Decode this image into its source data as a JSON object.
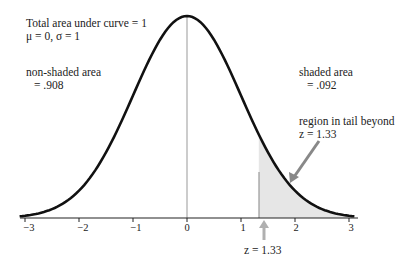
{
  "chart_data": {
    "type": "area",
    "annotations": {
      "total": "Total area under curve = 1",
      "params": "μ = 0, σ = 1",
      "nonshaded_label": "non-shaded area",
      "nonshaded_value": "= .908",
      "shaded_label": "shaded area",
      "shaded_value": "= .092",
      "tail_label": "region in tail beyond",
      "tail_z": "z = 1.33",
      "z_marker": "z = 1.33"
    },
    "x_ticks": [
      "−3",
      "−2",
      "−1",
      "0",
      "1",
      "2",
      "3"
    ],
    "xlim": [
      -3,
      3
    ],
    "mu": 0,
    "sigma": 1,
    "shaded_from": 1.33,
    "shaded_area": 0.092,
    "nonshaded_area": 0.908,
    "colors": {
      "curve": "#111111",
      "shade": "#e6e6e6",
      "arrow": "#8a8a8a",
      "marker": "#b0b0b0"
    }
  }
}
